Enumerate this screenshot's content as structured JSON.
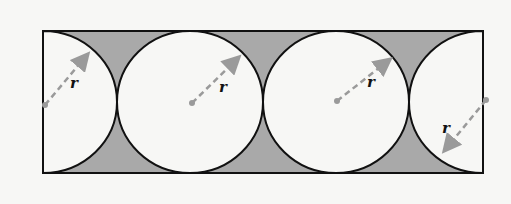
{
  "diagram": {
    "labels": {
      "r1": "r",
      "r2": "r",
      "r3": "r",
      "r4": "r"
    },
    "colors": {
      "shade": "#a9a9a9",
      "outline": "#111111",
      "radius_line": "#9a9a9a",
      "background": "#f7f7f5"
    }
  }
}
